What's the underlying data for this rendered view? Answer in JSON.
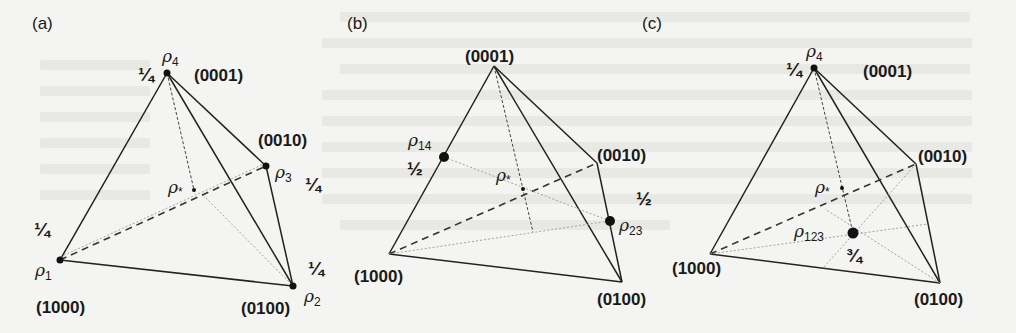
{
  "figure": {
    "panels": [
      {
        "id": "a",
        "label": "(a)",
        "vertices": {
          "v1000": "(1000)",
          "v0100": "(0100)",
          "v0010": "(0010)",
          "v0001": "(0001)"
        },
        "states": {
          "rho1": {
            "sym": "ρ",
            "sub": "1",
            "weight": "¼"
          },
          "rho2": {
            "sym": "ρ",
            "sub": "2",
            "weight": "¼"
          },
          "rho3": {
            "sym": "ρ",
            "sub": "3",
            "weight": "¼"
          },
          "rho4": {
            "sym": "ρ",
            "sub": "4",
            "weight": "¼"
          }
        },
        "center": {
          "sym": "ρ",
          "sub": "*"
        }
      },
      {
        "id": "b",
        "label": "(b)",
        "vertices": {
          "v1000": "(1000)",
          "v0100": "(0100)",
          "v0010": "(0010)",
          "v0001": "(0001)"
        },
        "states": {
          "rho14": {
            "sym": "ρ",
            "sub": "14",
            "weight": "½"
          },
          "rho23": {
            "sym": "ρ",
            "sub": "23",
            "weight": "½"
          }
        },
        "center": {
          "sym": "ρ",
          "sub": "*"
        }
      },
      {
        "id": "c",
        "label": "(c)",
        "vertices": {
          "v1000": "(1000)",
          "v0100": "(0100)",
          "v0010": "(0010)",
          "v0001": "(0001)"
        },
        "states": {
          "rho4": {
            "sym": "ρ",
            "sub": "4",
            "weight": "¼"
          },
          "rho123": {
            "sym": "ρ",
            "sub": "123",
            "weight": "¾"
          }
        },
        "center": {
          "sym": "ρ",
          "sub": "*"
        }
      }
    ]
  }
}
